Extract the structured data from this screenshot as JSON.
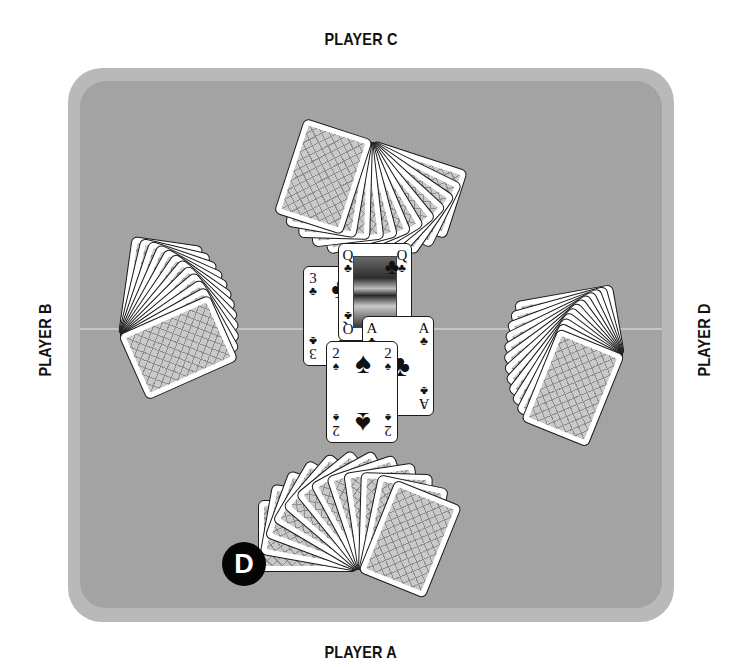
{
  "players": {
    "top": {
      "label": "PLAYER C"
    },
    "left": {
      "label": "PLAYER B"
    },
    "right": {
      "label": "PLAYER D"
    },
    "bottom": {
      "label": "PLAYER A"
    }
  },
  "dealer": {
    "glyph": "D"
  },
  "trick": [
    {
      "rank": "3",
      "suit": "♣",
      "suit_name": "clubs"
    },
    {
      "rank": "Q",
      "suit": "♣",
      "suit_name": "clubs"
    },
    {
      "rank": "A",
      "suit": "♣",
      "suit_name": "clubs"
    },
    {
      "rank": "2",
      "suit": "♠",
      "suit_name": "spades"
    }
  ],
  "hands": {
    "top_count": 12,
    "left_count": 12,
    "right_count": 12,
    "bottom_count": 12
  },
  "colors": {
    "table_rim": "#b9b9b9",
    "table_felt": "#a2a2a2",
    "dealer_button": "#050505"
  }
}
